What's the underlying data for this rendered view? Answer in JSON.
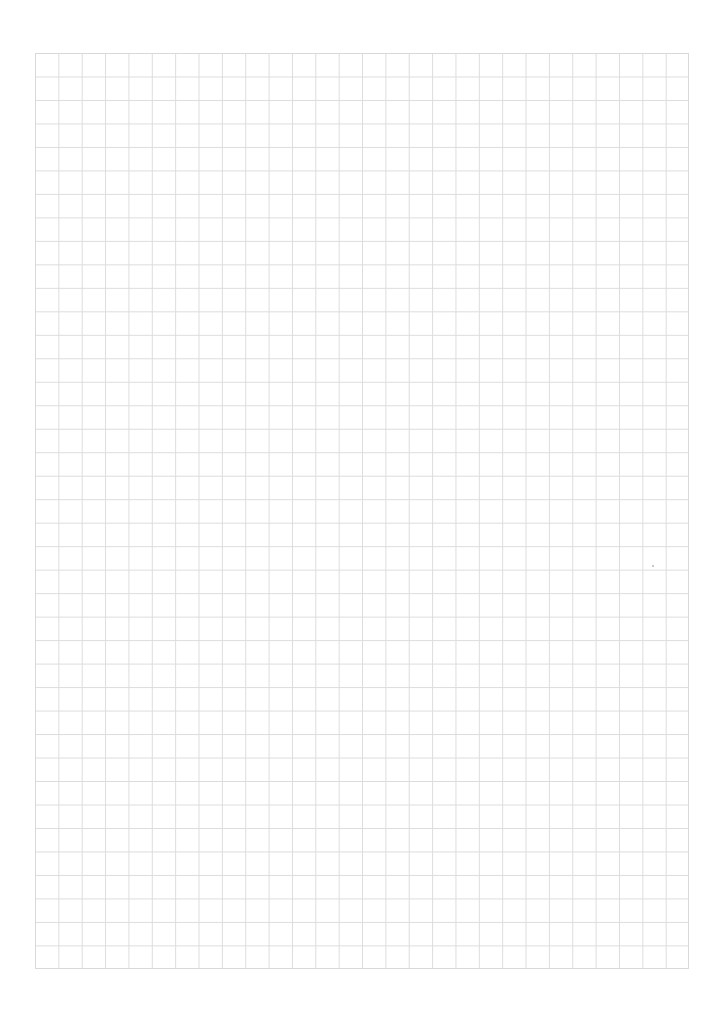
{
  "page": {
    "type": "graph-paper",
    "background": "#ffffff",
    "grid_line_color": "#dcdcdc",
    "columns": 28,
    "rows": 39
  }
}
